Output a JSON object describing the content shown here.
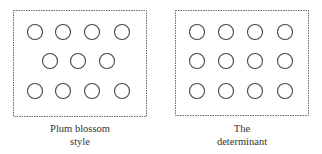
{
  "panels": [
    {
      "id": "plum-blossom",
      "caption_line1": "Plum blossom",
      "caption_line2": "style",
      "box": {
        "x": 13.5,
        "y": 10.5,
        "w": 133,
        "h": 106
      },
      "rows": [
        {
          "y": 32,
          "xs": [
            35,
            63,
            92,
            122
          ]
        },
        {
          "y": 61,
          "xs": [
            50,
            78,
            107
          ]
        },
        {
          "y": 91,
          "xs": [
            35,
            63,
            92,
            122
          ]
        }
      ]
    },
    {
      "id": "determinant",
      "caption_line1": "The",
      "caption_line2": "determinant",
      "box": {
        "x": 175.5,
        "y": 10.5,
        "w": 133,
        "h": 105
      },
      "rows": [
        {
          "y": 32,
          "xs": [
            197,
            226,
            255,
            285
          ]
        },
        {
          "y": 61,
          "xs": [
            197,
            226,
            255,
            285
          ]
        },
        {
          "y": 91,
          "xs": [
            197,
            226,
            255,
            285
          ]
        }
      ]
    }
  ],
  "style": {
    "stroke": "#444444",
    "radius": 7.5
  }
}
